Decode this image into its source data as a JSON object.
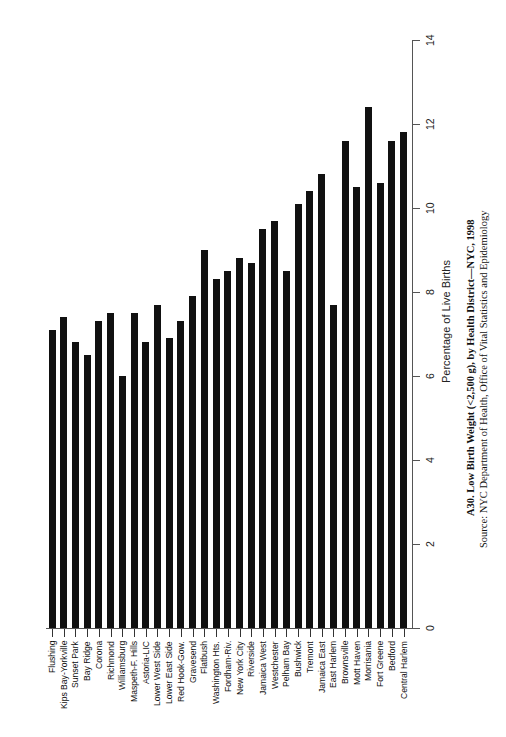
{
  "chart_data": {
    "type": "bar",
    "orientation": "vertical bars, page rotated 90 degrees counter-clockwise",
    "title": "A30. Low Birth Weight (<2,500 g), by Health District—NYC, 1998",
    "source": "Source: NYC Department of Health, Office of Vital Statistics and Epidemiology",
    "xlabel": "",
    "ylabel": "Percentage of Live Births",
    "ylim": [
      0,
      14
    ],
    "yticks": [
      "0",
      "2",
      "4",
      "6",
      "8",
      "10",
      "12",
      "14"
    ],
    "grid": false,
    "legend": null,
    "categories": [
      "Flushing",
      "Kips Bay-Yorkville",
      "Sunset Park",
      "Bay Ridge",
      "Corona",
      "Richmond",
      "Williamsburg",
      "Maspeth-F. Hills",
      "Astoria-LIC",
      "Lower West Side",
      "Lower East Side",
      "Red Hook-Gow.",
      "Gravesend",
      "Flatbush",
      "Washington Hts.",
      "Fordham-Riv.",
      "New York City",
      "Riverside",
      "Jamaica West",
      "Westchester",
      "Pelham Bay",
      "Bushwick",
      "Tremont",
      "Jamaica East",
      "East Harlem",
      "Brownsville",
      "Mott Haven",
      "Morrisania",
      "Fort Greene",
      "Bedford",
      "Central Harlem"
    ],
    "values": [
      7.1,
      7.4,
      6.8,
      6.5,
      7.3,
      7.5,
      6.0,
      7.5,
      6.8,
      7.7,
      6.9,
      7.3,
      7.9,
      9.0,
      8.3,
      8.5,
      8.8,
      8.7,
      9.5,
      9.7,
      8.5,
      10.1,
      10.4,
      10.8,
      7.7,
      11.6,
      10.5,
      12.4,
      10.6,
      11.6,
      11.8
    ],
    "bar_color": "#111111"
  }
}
